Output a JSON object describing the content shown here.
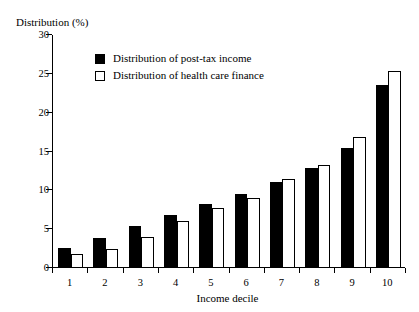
{
  "chart_data": {
    "type": "bar",
    "title": "",
    "ylabel": "Distribution (%)",
    "xlabel": "Income decile",
    "categories": [
      "1",
      "2",
      "3",
      "4",
      "5",
      "6",
      "7",
      "8",
      "9",
      "10"
    ],
    "series": [
      {
        "name": "Distribution of post-tax income",
        "color": "#000000",
        "style": "filled",
        "values": [
          2.6,
          3.9,
          5.4,
          6.8,
          8.2,
          9.5,
          11.1,
          12.9,
          15.4,
          23.5
        ]
      },
      {
        "name": "Distribution of health care finance",
        "color": "#ffffff",
        "style": "outlined",
        "values": [
          1.8,
          2.5,
          4.0,
          6.1,
          7.7,
          9.0,
          11.5,
          13.3,
          16.9,
          25.4
        ]
      }
    ],
    "ylim": [
      0,
      30
    ],
    "yticks": [
      0,
      5,
      10,
      15,
      20,
      25,
      30
    ],
    "ytick_labels": [
      "0",
      "5",
      "10",
      "15",
      "20",
      "25",
      "30"
    ],
    "grid": false,
    "legend_position": "upper-left-inside"
  },
  "legend": {
    "entries": [
      {
        "label": "Distribution of post-tax income",
        "swatch": "filled-black-square"
      },
      {
        "label": "Distribution of health care finance",
        "swatch": "open-white-square"
      }
    ]
  }
}
